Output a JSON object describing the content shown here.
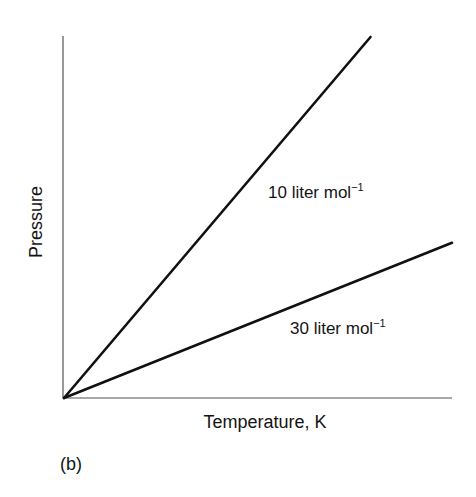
{
  "figure": {
    "panel_label": "(b)"
  },
  "chart_data": {
    "type": "line",
    "title": "",
    "xlabel": "Temperature, K",
    "ylabel": "Pressure",
    "xlim": [
      0,
      1
    ],
    "ylim": [
      0,
      1
    ],
    "grid": false,
    "ticks": "none",
    "series": [
      {
        "name": "10 liter mol⁻¹",
        "label_text": "10 liter mol",
        "label_sup": "−1",
        "x": [
          0,
          0.79
        ],
        "y": [
          0,
          1.0
        ],
        "color": "#111111"
      },
      {
        "name": "30 liter mol⁻¹",
        "label_text": "30 liter mol",
        "label_sup": "−1",
        "x": [
          0,
          1.0
        ],
        "y": [
          0,
          0.43
        ],
        "color": "#111111"
      }
    ],
    "annotations": [
      {
        "text": "10 liter mol⁻¹",
        "near_series": 0
      },
      {
        "text": "30 liter mol⁻¹",
        "near_series": 1
      }
    ]
  }
}
